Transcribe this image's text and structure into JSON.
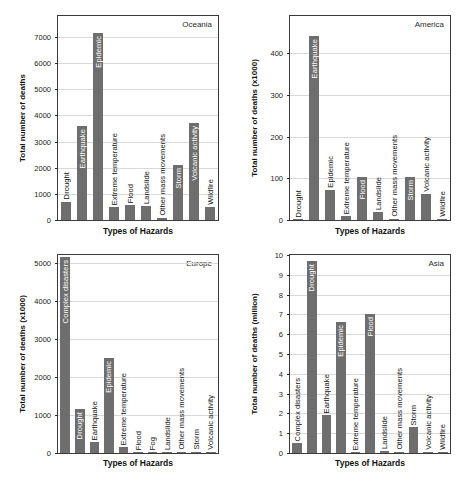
{
  "figure": {
    "background": "#ffffff",
    "bar_color": "#6e6e6e",
    "grid_color": "#d9d9d9",
    "axis_color": "#3a3a3a",
    "text_color": "#1a1a1a",
    "inside_label_color": "#ffffff"
  },
  "chart_data": [
    {
      "type": "bar",
      "region": "Oceania",
      "ylabel": "Total number of deaths",
      "xlabel": "Types of Hazards",
      "ylim": [
        0,
        7800
      ],
      "yticks": [
        0,
        1000,
        2000,
        3000,
        4000,
        5000,
        6000,
        7000
      ],
      "grid": true,
      "categories": [
        "Drought",
        "Earthquake",
        "Epidemic",
        "Extreme temperature",
        "Flood",
        "Landslide",
        "Other mass movements",
        "Storm",
        "Volcanic activity",
        "Wildfire"
      ],
      "values": [
        700,
        3600,
        7150,
        500,
        570,
        540,
        90,
        2100,
        3700,
        490
      ],
      "label_inside": [
        false,
        true,
        true,
        false,
        false,
        false,
        false,
        true,
        true,
        false
      ]
    },
    {
      "type": "bar",
      "region": "America",
      "ylabel": "Total number of deaths (x1000)",
      "xlabel": "Types of Hazards",
      "ylim": [
        0,
        490
      ],
      "yticks": [
        0,
        100,
        200,
        300,
        400
      ],
      "grid": true,
      "categories": [
        "Drought",
        "Earthquake",
        "Epidemic",
        "Extreme temperature",
        "Flood",
        "Landslide",
        "Other mass movements",
        "Storm",
        "Volcanic activity",
        "Wildfire"
      ],
      "values": [
        2,
        443,
        72,
        9,
        103,
        19,
        2,
        103,
        63,
        2
      ],
      "label_inside": [
        false,
        true,
        false,
        false,
        true,
        false,
        false,
        true,
        false,
        false
      ]
    },
    {
      "type": "bar",
      "region": "Europe",
      "ylabel": "Total number of deaths (x1000)",
      "xlabel": "Types of Hazards",
      "ylim": [
        0,
        5200
      ],
      "yticks": [
        0,
        1000,
        2000,
        3000,
        4000,
        5000
      ],
      "grid": true,
      "categories": [
        "Complex disasters",
        "Drought",
        "Earthquake",
        "Epidemic",
        "Extreme temperature",
        "Flood",
        "Fog",
        "Landslide",
        "Other mass movements",
        "Storm",
        "Volcanic activity"
      ],
      "values": [
        5150,
        1150,
        280,
        2500,
        150,
        20,
        10,
        15,
        5,
        20,
        3
      ],
      "label_inside": [
        true,
        true,
        false,
        true,
        false,
        false,
        false,
        false,
        false,
        false,
        false
      ]
    },
    {
      "type": "bar",
      "region": "Asia",
      "ylabel": "Total number of deaths (million)",
      "xlabel": "Types of Hazards",
      "ylim": [
        0,
        10
      ],
      "yticks": [
        0,
        1,
        2,
        3,
        4,
        5,
        6,
        7,
        8,
        9,
        10
      ],
      "grid": true,
      "categories": [
        "Complex disasters",
        "Drought",
        "Earthquake",
        "Epidemic",
        "Extreme temperature",
        "Flood",
        "Landslide",
        "Other mass movements",
        "Storm",
        "Volcanic activity",
        "Wildfire"
      ],
      "values": [
        0.5,
        9.7,
        1.9,
        6.6,
        0.05,
        7.0,
        0.1,
        0.03,
        1.3,
        0.06,
        0.02
      ],
      "label_inside": [
        false,
        true,
        false,
        true,
        false,
        true,
        false,
        false,
        false,
        false,
        false
      ]
    }
  ]
}
